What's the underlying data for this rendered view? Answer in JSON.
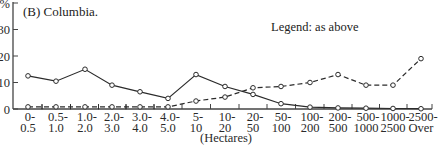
{
  "chart_data": {
    "type": "line",
    "title": "(B) Columbia.",
    "legend_note": "Legend: as above",
    "xlabel": "(Hectares)",
    "ylabel": "%",
    "ylim": [
      0,
      40
    ],
    "yticks": [
      0,
      10,
      20,
      30,
      40
    ],
    "ytick_labels": [
      "0",
      "10",
      "20",
      "30",
      "0%"
    ],
    "grid": false,
    "categories": [
      [
        "0-",
        "0.5"
      ],
      [
        "0.5-",
        "1.0"
      ],
      [
        "1.0-",
        "2.0"
      ],
      [
        "2.0-",
        "3.0"
      ],
      [
        "3.0-",
        "4.0"
      ],
      [
        "4.0-",
        "5.0"
      ],
      [
        "5-",
        "10"
      ],
      [
        "10-",
        "20"
      ],
      [
        "20-",
        "50"
      ],
      [
        "50-",
        "100"
      ],
      [
        "100-",
        "200"
      ],
      [
        "200-",
        "500"
      ],
      [
        "500-",
        "1000"
      ],
      [
        "1000-",
        "2500"
      ],
      [
        "2500-",
        "Over"
      ]
    ],
    "series": [
      {
        "name": "Series 1 (solid)",
        "style": "solid",
        "marker": "circle-open",
        "values": [
          12.5,
          10.5,
          15,
          9,
          6.5,
          4,
          13,
          8.5,
          5.5,
          2,
          0.7,
          0.4,
          0.3,
          0.2,
          0.1
        ]
      },
      {
        "name": "Series 2 (dashed)",
        "style": "dashed",
        "marker": "circle-open",
        "values": [
          0.8,
          0.8,
          0.8,
          0.8,
          0.8,
          0.8,
          3,
          4.5,
          8,
          8.5,
          10,
          13,
          9,
          9,
          19
        ]
      }
    ]
  },
  "colors": {
    "line": "#2b2b2b",
    "axis": "#444444",
    "background": "#ffffff"
  }
}
